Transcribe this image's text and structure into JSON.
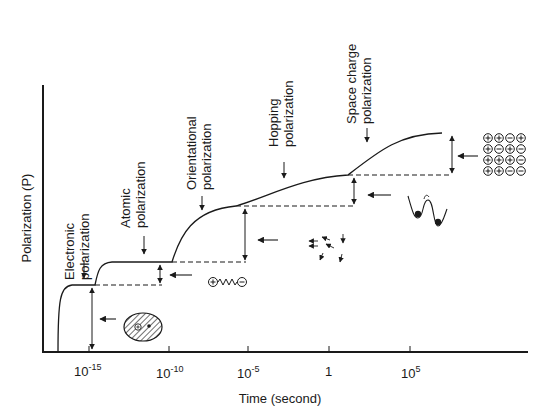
{
  "figure": {
    "y_axis_label": "Polarization (P)",
    "x_axis_label": "Time (second)",
    "x_ticks": [
      {
        "base": "10",
        "exp": "-15"
      },
      {
        "base": "10",
        "exp": "-10"
      },
      {
        "base": "10",
        "exp": "-5"
      },
      {
        "base": "1",
        "exp": ""
      },
      {
        "base": "10",
        "exp": "5"
      }
    ],
    "mechanisms": [
      {
        "line1": "Electronic",
        "line2": "polarization",
        "icon": "electron-cloud-icon"
      },
      {
        "line1": "Atomic",
        "line2": "polarization",
        "icon": "ion-spring-dipole-icon"
      },
      {
        "line1": "Orientational",
        "line2": "polarization",
        "icon": "rotating-dipoles-icon"
      },
      {
        "line1": "Hopping",
        "line2": "polarization",
        "icon": "double-well-hopping-icon"
      },
      {
        "line1": "Space charge",
        "line2": "polarization",
        "icon": "charge-grid-icon"
      }
    ],
    "charge_grid": [
      [
        "+",
        "+",
        "−",
        "+"
      ],
      [
        "+",
        "−",
        "+",
        "−"
      ],
      [
        "+",
        "+",
        "+",
        "−"
      ],
      [
        "+",
        "+",
        "−",
        "−"
      ]
    ],
    "dipole_signs": {
      "plus": "+",
      "minus": "−"
    },
    "colors": {
      "ink": "#1a1a1a",
      "background": "#ffffff",
      "hatch": "#333333"
    }
  },
  "chart_data": {
    "type": "line",
    "title": "",
    "xlabel": "Time (second)",
    "ylabel": "Polarization (P)",
    "x_scale": "log10",
    "x_tick_labels": [
      "10^-15",
      "10^-10",
      "10^-5",
      "1",
      "10^5"
    ],
    "x_tick_values": [
      -15,
      -10,
      -5,
      0,
      5
    ],
    "xlim_log10": [
      -18.5,
      12
    ],
    "ylim_relative": [
      0,
      1
    ],
    "grid": false,
    "legend": "none",
    "series": [
      {
        "name": "Cumulative polarization P(t)",
        "points_log10t_relP": [
          [
            -17.6,
            0.0
          ],
          [
            -17.4,
            0.18
          ],
          [
            -17.0,
            0.25
          ],
          [
            -16.5,
            0.26
          ],
          [
            -15.3,
            0.26
          ],
          [
            -14.8,
            0.32
          ],
          [
            -14.2,
            0.34
          ],
          [
            -10.6,
            0.34
          ],
          [
            -9.8,
            0.47
          ],
          [
            -8.5,
            0.55
          ],
          [
            -6.8,
            0.58
          ],
          [
            -6.2,
            0.58
          ],
          [
            -3.0,
            0.64
          ],
          [
            0.0,
            0.69
          ],
          [
            1.0,
            0.7
          ],
          [
            3.0,
            0.77
          ],
          [
            5.5,
            0.82
          ]
        ]
      }
    ],
    "step_levels_relative": [
      {
        "mechanism": "Electronic polarization",
        "relP": 0.26
      },
      {
        "mechanism": "Atomic polarization",
        "relP": 0.34
      },
      {
        "mechanism": "Orientational polarization",
        "relP": 0.58
      },
      {
        "mechanism": "Hopping polarization",
        "relP": 0.7
      },
      {
        "mechanism": "Space charge polarization",
        "relP": 0.82
      }
    ],
    "annotations": [
      "Electronic polarization",
      "Atomic polarization",
      "Orientational polarization",
      "Hopping polarization",
      "Space charge polarization"
    ]
  }
}
